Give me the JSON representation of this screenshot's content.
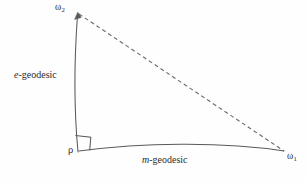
{
  "figure": {
    "type": "geodesic-triangle",
    "width": 307,
    "height": 183,
    "background_color": "#fefefe",
    "stroke_color": "#5a5a5a",
    "text_color": "#2b2b2b"
  },
  "labels": {
    "omega2": {
      "base": "ω",
      "sub": "2"
    },
    "omega1": {
      "base": "ω",
      "sub": "1"
    },
    "rho": "ρ",
    "e_geodesic": {
      "italic": "e",
      "rest": "-geodesic"
    },
    "m_geodesic": {
      "italic": "m",
      "rest": "-geodesic"
    }
  },
  "geometry": {
    "vertices": {
      "rho": {
        "x": 78,
        "y": 152
      },
      "omega2": {
        "x": 78,
        "y": 13
      },
      "omega1": {
        "x": 285,
        "y": 152
      }
    },
    "e_geodesic_path": "M 78 152 C 74.5 115, 73.5 70, 77.5 15",
    "m_geodesic_path": "M 79 151 C 140 143, 220 141, 284 151",
    "dashed_chord_path": "M 79 14 L 284 151",
    "right_angle_marker_path": "M 75.5 136 L 90.5 137.5 L 89.5 150.5 L 78.5 151.5",
    "arrowhead_at": "omega2",
    "dash_pattern": "4 3",
    "stroke_width": 1
  }
}
